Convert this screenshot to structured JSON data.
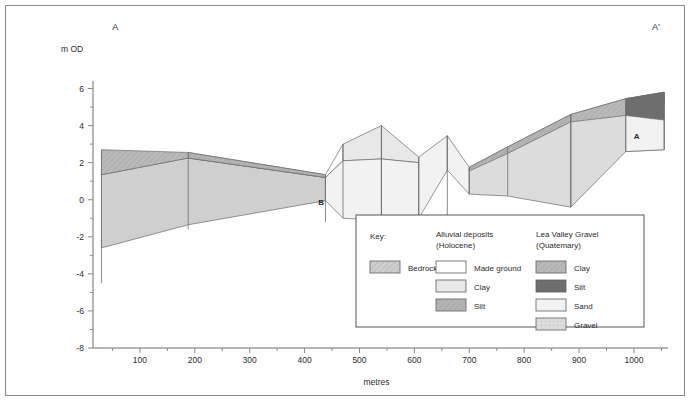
{
  "figure": {
    "section_label_left": "A",
    "section_label_right": "A'",
    "y_axis_unit": "m OD",
    "x_axis_title": "metres",
    "inline_labels": [
      {
        "text": "B",
        "x": 430,
        "y": -0.3
      },
      {
        "text": "A",
        "x": 1005,
        "y": 3.3
      }
    ]
  },
  "axes": {
    "y": {
      "min": -8,
      "max": 7,
      "major_ticks": [
        -8,
        -6,
        -4,
        -2,
        0,
        2,
        4,
        6
      ],
      "minor_ticks": [
        -7,
        -5,
        -3,
        -1,
        1,
        3,
        5
      ],
      "tick_labels": [
        "-8",
        "-6",
        "-4",
        "-2",
        "0",
        "2",
        "4",
        "6"
      ]
    },
    "x": {
      "min": 0,
      "max": 1062,
      "major_ticks": [
        100,
        200,
        300,
        400,
        500,
        600,
        700,
        800,
        900,
        1000
      ],
      "minor_ticks": [
        50,
        150,
        250,
        350,
        450,
        550,
        650,
        750,
        850,
        950,
        1050
      ],
      "tick_labels": [
        "100",
        "200",
        "300",
        "400",
        "500",
        "600",
        "700",
        "800",
        "900",
        "1000"
      ]
    }
  },
  "colors": {
    "bedrock": "#cfcfcf",
    "made_ground": "#ffffff",
    "alluvial_clay": "#e8e8e8",
    "alluvial_silt": "#b4b4b4",
    "lvg_clay": "#b9b9b9",
    "lvg_silt": "#6e6e6e",
    "lvg_sand": "#f2f2f2",
    "lvg_gravel": "#dcdcdc",
    "outline": "#6a6a6a",
    "axis": "#6d6d6d",
    "text": "#2b2b2b"
  },
  "legend": {
    "key_title": "Key:",
    "columns": [
      {
        "heading_line1": "",
        "heading_line2": "",
        "entries": [
          {
            "label": "Bedrock",
            "fill_key": "bedrock",
            "pattern": "hatch"
          }
        ]
      },
      {
        "heading_line1": "Alluvial deposits",
        "heading_line2": "(Holocene)",
        "entries": [
          {
            "label": "Made ground",
            "fill_key": "made_ground",
            "pattern": "none"
          },
          {
            "label": "Clay",
            "fill_key": "alluvial_clay",
            "pattern": "none"
          },
          {
            "label": "Silt",
            "fill_key": "alluvial_silt",
            "pattern": "hatch"
          }
        ]
      },
      {
        "heading_line1": "Lea Valley Gravel",
        "heading_line2": "(Quatemary)",
        "entries": [
          {
            "label": "Clay",
            "fill_key": "lvg_clay",
            "pattern": "hatch"
          },
          {
            "label": "Silt",
            "fill_key": "lvg_silt",
            "pattern": "none"
          },
          {
            "label": "Sand",
            "fill_key": "lvg_sand",
            "pattern": "none"
          },
          {
            "label": "Gravel",
            "fill_key": "lvg_gravel",
            "pattern": "dots"
          }
        ]
      }
    ]
  },
  "chart_data": {
    "type": "area",
    "xlabel": "metres",
    "ylabel": "m OD",
    "xlim": [
      0,
      1062
    ],
    "ylim": [
      -8,
      7
    ],
    "grid": false,
    "legend_position": "inside-bottom-centre",
    "boreholes": [
      {
        "x": 30,
        "top": 2.7,
        "bottom": -4.5
      },
      {
        "x": 188,
        "top": 2.55,
        "bottom": -1.6
      },
      {
        "x": 438,
        "top": 1.35,
        "bottom": -1.2
      },
      {
        "x": 470,
        "top": 3.0,
        "bottom": -1.0
      },
      {
        "x": 540,
        "top": 4.0,
        "bottom": -1.1
      },
      {
        "x": 608,
        "top": 2.3,
        "bottom": -1.0
      },
      {
        "x": 660,
        "top": 3.45,
        "bottom": -0.9
      },
      {
        "x": 700,
        "top": 1.75,
        "bottom": 0.3
      },
      {
        "x": 770,
        "top": 2.85,
        "bottom": 0.2
      },
      {
        "x": 885,
        "top": 4.6,
        "bottom": -0.4
      },
      {
        "x": 985,
        "top": 5.45,
        "bottom": 2.6
      },
      {
        "x": 1055,
        "top": 5.8,
        "bottom": 2.7
      }
    ],
    "units": [
      {
        "name": "Bedrock left block",
        "fill_key": "bedrock",
        "pattern": "none",
        "points": [
          [
            30,
            1.35
          ],
          [
            188,
            2.25
          ],
          [
            438,
            1.2
          ],
          [
            438,
            -0.05
          ],
          [
            188,
            -1.35
          ],
          [
            30,
            -2.6
          ]
        ]
      },
      {
        "name": "Lea Valley Clay cap left",
        "fill_key": "lvg_clay",
        "pattern": "hatch",
        "points": [
          [
            30,
            2.7
          ],
          [
            188,
            2.55
          ],
          [
            438,
            1.35
          ],
          [
            438,
            1.2
          ],
          [
            188,
            2.25
          ],
          [
            30,
            1.35
          ]
        ]
      },
      {
        "name": "Alluvial silt wedge left-mid",
        "fill_key": "alluvial_silt",
        "pattern": "hatch",
        "points": [
          [
            188,
            2.55
          ],
          [
            438,
            1.35
          ],
          [
            438,
            1.2
          ],
          [
            188,
            2.25
          ]
        ]
      },
      {
        "name": "Made ground block 438-470",
        "fill_key": "made_ground",
        "pattern": "none",
        "points": [
          [
            438,
            1.35
          ],
          [
            470,
            3.0
          ],
          [
            470,
            2.1
          ],
          [
            438,
            1.2
          ]
        ]
      },
      {
        "name": "Alluvial clay block 470-540",
        "fill_key": "alluvial_clay",
        "pattern": "none",
        "points": [
          [
            470,
            3.0
          ],
          [
            540,
            4.0
          ],
          [
            540,
            2.2
          ],
          [
            470,
            2.1
          ]
        ]
      },
      {
        "name": "Lower block 438-540",
        "fill_key": "lvg_sand",
        "pattern": "none",
        "points": [
          [
            438,
            1.2
          ],
          [
            470,
            2.1
          ],
          [
            540,
            2.2
          ],
          [
            540,
            -1.1
          ],
          [
            470,
            -1.0
          ],
          [
            438,
            -0.05
          ]
        ]
      },
      {
        "name": "Alluvial clay block 540-608",
        "fill_key": "alluvial_clay",
        "pattern": "none",
        "points": [
          [
            540,
            4.0
          ],
          [
            608,
            2.3
          ],
          [
            608,
            2.0
          ],
          [
            540,
            2.2
          ]
        ]
      },
      {
        "name": "Lower block 540-608",
        "fill_key": "lvg_sand",
        "pattern": "none",
        "points": [
          [
            540,
            2.2
          ],
          [
            608,
            2.0
          ],
          [
            608,
            -1.0
          ],
          [
            540,
            -1.1
          ]
        ]
      },
      {
        "name": "Peak block 608-660",
        "fill_key": "lvg_sand",
        "pattern": "none",
        "points": [
          [
            608,
            2.3
          ],
          [
            660,
            3.45
          ],
          [
            660,
            1.6
          ],
          [
            608,
            -1.0
          ]
        ]
      },
      {
        "name": "Peak block 660-700",
        "fill_key": "lvg_sand",
        "pattern": "none",
        "points": [
          [
            660,
            3.45
          ],
          [
            700,
            1.75
          ],
          [
            700,
            0.3
          ],
          [
            660,
            1.6
          ]
        ]
      },
      {
        "name": "Gravel wedge 700-885",
        "fill_key": "lvg_gravel",
        "pattern": "none",
        "points": [
          [
            700,
            1.75
          ],
          [
            770,
            2.85
          ],
          [
            885,
            4.6
          ],
          [
            885,
            -0.4
          ],
          [
            770,
            0.2
          ],
          [
            700,
            0.3
          ]
        ]
      },
      {
        "name": "Alluvial silt cap 700-885",
        "fill_key": "alluvial_silt",
        "pattern": "hatch",
        "points": [
          [
            700,
            1.75
          ],
          [
            770,
            2.85
          ],
          [
            885,
            4.6
          ],
          [
            885,
            4.2
          ],
          [
            770,
            2.5
          ],
          [
            700,
            1.55
          ]
        ]
      },
      {
        "name": "Gravel wedge 885-1055",
        "fill_key": "lvg_gravel",
        "pattern": "none",
        "points": [
          [
            885,
            4.6
          ],
          [
            985,
            5.45
          ],
          [
            1055,
            5.8
          ],
          [
            1055,
            2.7
          ],
          [
            985,
            2.6
          ],
          [
            885,
            -0.4
          ]
        ]
      },
      {
        "name": "Lea Valley Clay cap 885-1055",
        "fill_key": "lvg_clay",
        "pattern": "hatch",
        "points": [
          [
            885,
            4.6
          ],
          [
            985,
            5.45
          ],
          [
            1055,
            5.8
          ],
          [
            1055,
            5.1
          ],
          [
            985,
            4.55
          ],
          [
            885,
            4.2
          ]
        ]
      },
      {
        "name": "Lea Valley Silt wedge right",
        "fill_key": "lvg_silt",
        "pattern": "none",
        "points": [
          [
            985,
            5.45
          ],
          [
            1055,
            5.8
          ],
          [
            1055,
            4.3
          ],
          [
            985,
            4.55
          ]
        ]
      },
      {
        "name": "Sand block right 985-1055",
        "fill_key": "lvg_sand",
        "pattern": "none",
        "points": [
          [
            985,
            4.55
          ],
          [
            1055,
            4.3
          ],
          [
            1055,
            2.7
          ],
          [
            985,
            2.6
          ]
        ]
      }
    ]
  }
}
